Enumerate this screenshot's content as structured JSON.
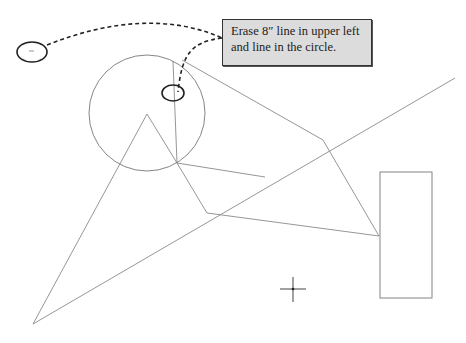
{
  "callout": {
    "lines": [
      "Erase 8″ line in upper left",
      "and line in the circle."
    ],
    "background": "#dcdcdc",
    "border": "#333333"
  },
  "colors": {
    "geometry_line": "#8a8a8a",
    "annotation": "#222222",
    "background": "#ffffff"
  },
  "shapes": {
    "large_circle": {
      "cx": 147,
      "cy": 113,
      "r": 58
    },
    "marker_ellipse_upper_left": {
      "cx": 32,
      "cy": 52,
      "rx": 15,
      "ry": 10
    },
    "marker_ellipse_in_circle": {
      "cx": 173,
      "cy": 93,
      "rx": 11,
      "ry": 8
    },
    "rectangle": {
      "x": 380,
      "y": 172,
      "width": 52,
      "height": 126
    },
    "crosshair": {
      "x": 293,
      "y": 289,
      "size": 13
    }
  }
}
